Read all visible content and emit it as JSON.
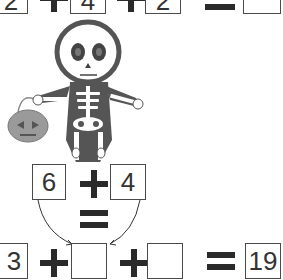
{
  "puzzle": {
    "top_row": {
      "a": "2",
      "b": "4",
      "c": "2",
      "result": ""
    },
    "hint": {
      "left": "6",
      "right": "4"
    },
    "bottom_row": {
      "a": "3",
      "b": "",
      "c": "",
      "result": "19"
    }
  },
  "illustration": {
    "character": "skeleton",
    "prop": "jack-o-lantern pumpkin bucket"
  },
  "colors": {
    "line": "#4a4a4a",
    "skeleton_body": "#555555",
    "pumpkin": "#9a9a9a"
  }
}
